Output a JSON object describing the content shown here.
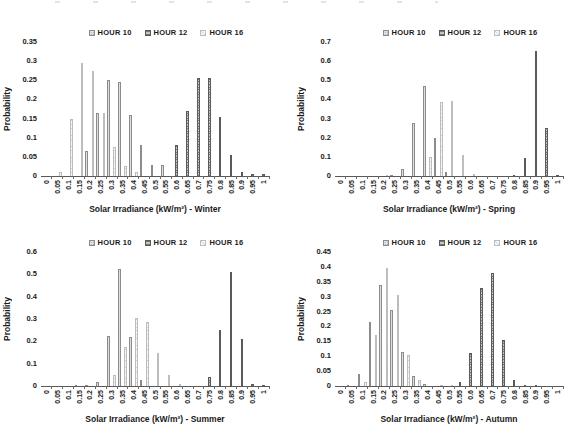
{
  "accent_colors": {
    "axis_line": "#595959",
    "text": "#1a1a1a",
    "hour10_fill": "#e2e2e2",
    "hour12_fill": "#b3b3b3",
    "hour16_fill": "#f3f3f3"
  },
  "legend_labels": [
    "HOUR 10",
    "HOUR 12",
    "HOUR 16"
  ],
  "chart_data": [
    {
      "type": "bar",
      "season": "Winter",
      "xlabel": "Solar Irradiance (kW/m²) -  Winter",
      "ylabel": "Probability",
      "ylim": [
        0,
        0.35
      ],
      "yticks": [
        "0",
        "0.05",
        "0.1",
        "0.15",
        "0.2",
        "0.25",
        "0.3",
        "0.35"
      ],
      "grid": false,
      "legend_position": "top-center",
      "categories": [
        "0",
        "0.05",
        "0.1",
        "0.15",
        "0.2",
        "0.25",
        "0.3",
        "0.35",
        "0.4",
        "0.45",
        "0.5",
        "0.55",
        "0.6",
        "0.65",
        "0.7",
        "0.75",
        "0.8",
        "0.85",
        "0.9",
        "0.95",
        "1"
      ],
      "series": [
        {
          "name": "HOUR 10",
          "values": [
            0,
            0,
            0,
            0,
            0.065,
            0.165,
            0.25,
            0.245,
            0.16,
            0.08,
            0.03,
            0.03,
            0,
            0,
            0,
            0,
            0,
            0,
            0,
            0,
            0
          ]
        },
        {
          "name": "HOUR 12",
          "values": [
            0,
            0,
            0,
            0,
            0,
            0,
            0,
            0,
            0,
            0,
            0,
            0,
            0.08,
            0.17,
            0.255,
            0.255,
            0.155,
            0.055,
            0.01,
            0.005,
            0.005
          ]
        },
        {
          "name": "HOUR 16",
          "values": [
            0,
            0.01,
            0.15,
            0.295,
            0.275,
            0.165,
            0.075,
            0.025,
            0.01,
            0,
            0,
            0,
            0,
            0,
            0,
            0,
            0,
            0,
            0,
            0,
            0
          ]
        }
      ]
    },
    {
      "type": "bar",
      "season": "Spring",
      "xlabel": "Solar Irradiance (kW/m²) -  Spring",
      "ylabel": "Probability",
      "ylim": [
        0,
        0.7
      ],
      "yticks": [
        "0",
        "0.1",
        "0.2",
        "0.3",
        "0.4",
        "0.5",
        "0.6",
        "0.7"
      ],
      "grid": false,
      "legend_position": "top-center",
      "categories": [
        "0",
        "0.05",
        "0.1",
        "0.15",
        "0.2",
        "0.25",
        "0.3",
        "0.35",
        "0.4",
        "0.45",
        "0.5",
        "0.55",
        "0.6",
        "0.65",
        "0.7",
        "0.75",
        "0.8",
        "0.85",
        "0.9",
        "0.95",
        "1"
      ],
      "series": [
        {
          "name": "HOUR 10",
          "values": [
            0,
            0,
            0,
            0,
            0,
            0.005,
            0.035,
            0.275,
            0.47,
            0.2,
            0.02,
            0,
            0,
            0,
            0,
            0,
            0,
            0,
            0,
            0,
            0
          ]
        },
        {
          "name": "HOUR 12",
          "values": [
            0,
            0,
            0,
            0,
            0,
            0,
            0,
            0,
            0,
            0,
            0,
            0,
            0,
            0,
            0,
            0,
            0.005,
            0.095,
            0.655,
            0.25,
            0.005
          ]
        },
        {
          "name": "HOUR 16",
          "values": [
            0,
            0,
            0,
            0,
            0.005,
            0,
            0,
            0,
            0.1,
            0.385,
            0.39,
            0.11,
            0.01,
            0,
            0,
            0,
            0,
            0,
            0,
            0,
            0
          ]
        }
      ]
    },
    {
      "type": "bar",
      "season": "Summer",
      "xlabel": "Solar Irradiance (kW/m²) - Summer",
      "ylabel": "Probability",
      "ylim": [
        0,
        0.6
      ],
      "yticks": [
        "0",
        "0.1",
        "0.2",
        "0.3",
        "0.4",
        "0.5",
        "0.6"
      ],
      "grid": false,
      "legend_position": "top-center",
      "categories": [
        "0",
        "0.05",
        "0.1",
        "0.15",
        "0.2",
        "0.25",
        "0.3",
        "0.35",
        "0.4",
        "0.45",
        "0.5",
        "0.55",
        "0.6",
        "0.65",
        "0.7",
        "0.75",
        "0.8",
        "0.85",
        "0.9",
        "0.95",
        "1"
      ],
      "series": [
        {
          "name": "HOUR 10",
          "values": [
            0,
            0,
            0,
            0.005,
            0.005,
            0.02,
            0.225,
            0.525,
            0.22,
            0.025,
            0,
            0,
            0,
            0,
            0,
            0,
            0,
            0,
            0,
            0,
            0
          ]
        },
        {
          "name": "HOUR 12",
          "values": [
            0,
            0,
            0,
            0,
            0,
            0,
            0,
            0,
            0,
            0,
            0,
            0,
            0,
            0,
            0,
            0.04,
            0.25,
            0.51,
            0.21,
            0.01,
            0.005
          ]
        },
        {
          "name": "HOUR 16",
          "values": [
            0,
            0,
            0,
            0,
            0,
            0,
            0.05,
            0.175,
            0.305,
            0.285,
            0.15,
            0.05,
            0.01,
            0,
            0,
            0,
            0,
            0,
            0,
            0,
            0
          ]
        }
      ]
    },
    {
      "type": "bar",
      "season": "Autumn",
      "xlabel": "Solar Irradiance (kW/m²) - Autumn",
      "ylabel": "Probability",
      "ylim": [
        0,
        0.45
      ],
      "yticks": [
        "0",
        "0.05",
        "0.1",
        "0.15",
        "0.2",
        "0.25",
        "0.3",
        "0.35",
        "0.4",
        "0.45"
      ],
      "grid": false,
      "legend_position": "top-center",
      "categories": [
        "0",
        "0.05",
        "0.1",
        "0.15",
        "0.2",
        "0.25",
        "0.3",
        "0.35",
        "0.4",
        "0.45",
        "0.5",
        "0.55",
        "0.6",
        "0.65",
        "0.7",
        "0.75",
        "0.8",
        "0.85",
        "0.9",
        "0.95",
        "1"
      ],
      "series": [
        {
          "name": "HOUR 10",
          "values": [
            0,
            0.005,
            0.04,
            0.215,
            0.34,
            0.255,
            0.115,
            0.035,
            0.008,
            0,
            0,
            0,
            0,
            0,
            0,
            0,
            0,
            0,
            0,
            0,
            0
          ]
        },
        {
          "name": "HOUR 12",
          "values": [
            0,
            0,
            0,
            0,
            0,
            0,
            0,
            0,
            0,
            0,
            0,
            0.015,
            0.11,
            0.33,
            0.38,
            0.155,
            0.02,
            0.005,
            0.005,
            0,
            0
          ]
        },
        {
          "name": "HOUR 16",
          "values": [
            0,
            0,
            0.015,
            0.17,
            0.395,
            0.305,
            0.105,
            0.02,
            0,
            0.005,
            0.005,
            0,
            0,
            0,
            0,
            0,
            0,
            0,
            0,
            0,
            0
          ]
        }
      ]
    }
  ]
}
